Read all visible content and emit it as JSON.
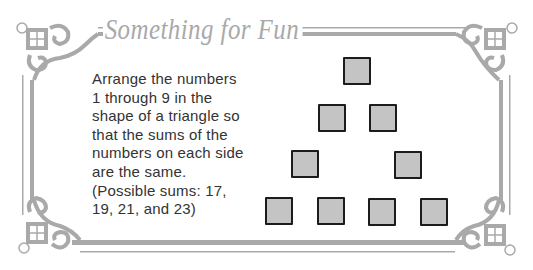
{
  "title": "Something for Fun",
  "puzzle": {
    "lines": [
      "Arrange the numbers",
      "1 through 9 in the",
      "shape of a triangle so",
      "that the sums of the",
      "numbers on each side",
      "are the same.",
      "(Possible sums: 17,",
      "19, 21, and 23)"
    ]
  },
  "triangle": {
    "box_count": 9,
    "rows": [
      1,
      2,
      2,
      4
    ],
    "box_fill": "#c4c4c4",
    "box_border": "#1c1c1c"
  },
  "colors": {
    "ornament": "#a9a9a9",
    "text": "#333333"
  }
}
